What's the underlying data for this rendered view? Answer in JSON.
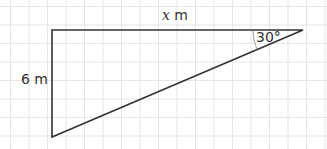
{
  "diagram": {
    "type": "right-triangle",
    "grid": {
      "spacing": 18.5,
      "color": "#e6e6e6",
      "origin_x": 10.5,
      "origin_y": 6.5
    },
    "vertices": {
      "top_left": [
        52,
        30
      ],
      "top_right": [
        303,
        30
      ],
      "bottom_left": [
        52,
        137
      ]
    },
    "labels": {
      "top_side_var": "x",
      "top_side_unit": " m",
      "left_side": "6 m",
      "angle": "30°"
    },
    "colors": {
      "stroke": "#333333",
      "arc": "#888888"
    }
  }
}
